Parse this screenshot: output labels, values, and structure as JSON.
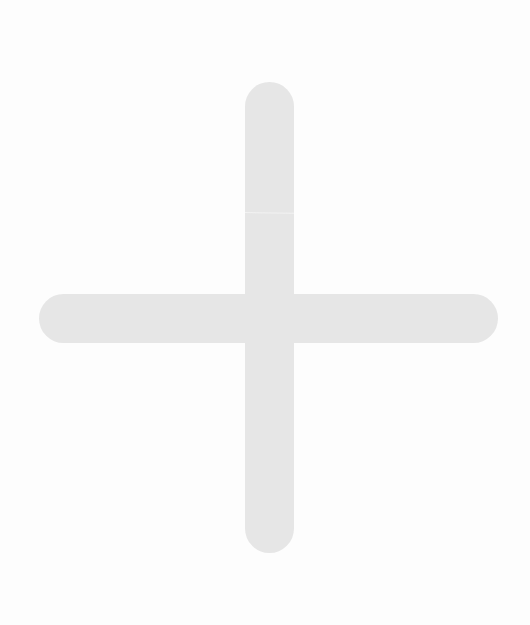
{
  "icon": {
    "semantic": "plus-icon",
    "label": "Add",
    "colors": {
      "background": "#fdfdfd",
      "glyph": "#e6e6e6",
      "seam": "#f2f2f2"
    }
  }
}
